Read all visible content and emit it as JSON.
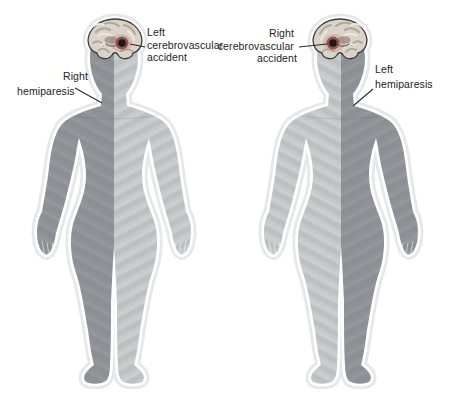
{
  "figure_left": {
    "cva_label_lines": [
      "Left",
      "cerebrovascular",
      "accident"
    ],
    "hemiparesis_label_lines": [
      "Right",
      "hemiparesis"
    ]
  },
  "figure_right": {
    "cva_label_lines": [
      "Right",
      "cerebrovascular",
      "accident"
    ],
    "hemiparesis_label_lines": [
      "Left",
      "hemiparesis"
    ]
  },
  "colors": {
    "affected_side": "#8f9296",
    "unaffected_side": "#c6c8ca",
    "body_outline": "#ffffff",
    "body_halo": "#e5e7e8",
    "brain_base": "#d9d3ca",
    "brain_outline": "#3b3b3b",
    "lesion_core": "#241517",
    "lesion_inner": "#7c3b38",
    "lesion_halo": "#c26a5e",
    "label_text": "#232323",
    "leader_line": "#2b2b2b"
  },
  "icons": {
    "brain": "brain-coronal-section-illustration",
    "lesion": "stroke-lesion-spot"
  }
}
